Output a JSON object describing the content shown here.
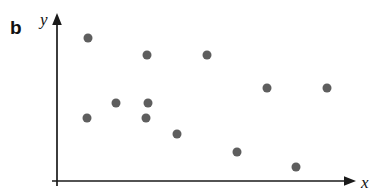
{
  "figure": {
    "panel_label": "b",
    "background_color": "#ffffff"
  },
  "chart_data": {
    "type": "scatter",
    "title": "",
    "subtitle": "",
    "xlabel": "x",
    "ylabel": "y",
    "xlim": [
      0,
      100
    ],
    "ylim": [
      0,
      100
    ],
    "grid": false,
    "legend": null,
    "tick_labels": {
      "x": [],
      "y": []
    },
    "marker": {
      "shape": "circle",
      "color": "#5e5e5e",
      "radius_px": 4.5
    },
    "axis": {
      "color": "#1a1a1a",
      "width_px": 1.6,
      "arrow_heads": [
        "x-end",
        "y-end"
      ]
    },
    "n_points": 12,
    "points": [
      {
        "x": 10.3,
        "y": 85.6
      },
      {
        "x": 10.0,
        "y": 37.7
      },
      {
        "x": 19.7,
        "y": 46.7
      },
      {
        "x": 30.0,
        "y": 75.4
      },
      {
        "x": 29.7,
        "y": 37.7
      },
      {
        "x": 30.3,
        "y": 46.7
      },
      {
        "x": 40.0,
        "y": 28.1
      },
      {
        "x": 50.0,
        "y": 75.4
      },
      {
        "x": 60.0,
        "y": 17.4
      },
      {
        "x": 70.0,
        "y": 55.7
      },
      {
        "x": 79.7,
        "y": 8.4
      },
      {
        "x": 90.0,
        "y": 55.7
      }
    ],
    "pixel_points": [
      {
        "cx": 88,
        "cy": 38
      },
      {
        "cx": 87,
        "cy": 118
      },
      {
        "cx": 116,
        "cy": 103
      },
      {
        "cx": 147,
        "cy": 55
      },
      {
        "cx": 146,
        "cy": 118
      },
      {
        "cx": 148,
        "cy": 103
      },
      {
        "cx": 177,
        "cy": 134
      },
      {
        "cx": 207,
        "cy": 55
      },
      {
        "cx": 237,
        "cy": 152
      },
      {
        "cx": 267,
        "cy": 88
      },
      {
        "cx": 296,
        "cy": 167
      },
      {
        "cx": 327,
        "cy": 88
      }
    ]
  }
}
